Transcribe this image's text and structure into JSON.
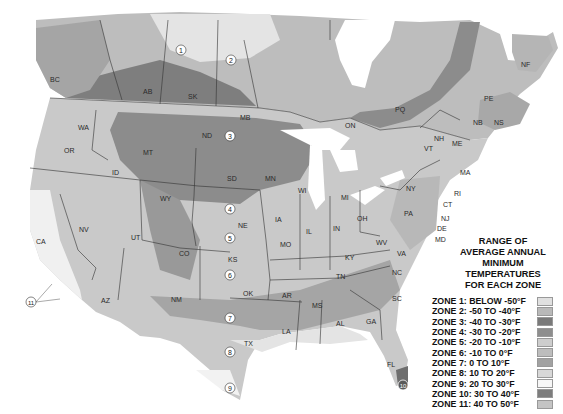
{
  "legend": {
    "title_lines": [
      "RANGE OF",
      "AVERAGE ANNUAL",
      "MINIMUM TEMPERATURES",
      "FOR EACH ZONE"
    ],
    "zones": [
      {
        "label": "ZONE 1: BELOW -50°F",
        "color": "#e0e0e0"
      },
      {
        "label": "ZONE 2: -50 TO -40°F",
        "color": "#b9b9b9"
      },
      {
        "label": "ZONE 3: -40 TO -30°F",
        "color": "#7a7a7a"
      },
      {
        "label": "ZONE 4: -30 TO -20°F",
        "color": "#8e8e8e"
      },
      {
        "label": "ZONE 5: -20 TO -10°F",
        "color": "#cdcdcd"
      },
      {
        "label": "ZONE 6: -10 TO 0°F",
        "color": "#bdbdbd"
      },
      {
        "label": "ZONE 7: 0 TO 10°F",
        "color": "#a2a2a2"
      },
      {
        "label": "ZONE 8: 10 TO 20°F",
        "color": "#d8d8d8"
      },
      {
        "label": "ZONE 9: 20 TO 30°F",
        "color": "#f7f7f7"
      },
      {
        "label": "ZONE 10: 30 TO 40°F",
        "color": "#7d7d7d"
      },
      {
        "label": "ZONE 11: 40 TO 50°F",
        "color": "#c4c4c4"
      }
    ]
  },
  "map": {
    "region_labels": {
      "BC": "BC",
      "AB": "AB",
      "SK": "SK",
      "MB": "MB",
      "ON": "ON",
      "PQ": "PQ",
      "NF": "NF",
      "PE": "PE",
      "NB": "NB",
      "NS": "NS",
      "WA": "WA",
      "OR": "OR",
      "ID": "ID",
      "MT": "MT",
      "WY": "WY",
      "NV": "NV",
      "CA": "CA",
      "UT": "UT",
      "CO": "CO",
      "AZ": "AZ",
      "NM": "NM",
      "ND": "ND",
      "SD": "SD",
      "NE": "NE",
      "KS": "KS",
      "OK": "OK",
      "TX": "TX",
      "MN": "MN",
      "IA": "IA",
      "MO": "MO",
      "AR": "AR",
      "LA": "LA",
      "WI": "WI",
      "IL": "IL",
      "MI": "MI",
      "IN": "IN",
      "OH": "OH",
      "KY": "KY",
      "TN": "TN",
      "MS": "MS",
      "AL": "AL",
      "GA": "GA",
      "FL": "FL",
      "SC": "SC",
      "NC": "NC",
      "VA": "VA",
      "WV": "WV",
      "PA": "PA",
      "NY": "NY",
      "VT": "VT",
      "NH": "NH",
      "ME": "ME",
      "MA": "MA",
      "RI": "RI",
      "CT": "CT",
      "NJ": "NJ",
      "DE": "DE",
      "MD": "MD"
    },
    "zone_markers": [
      "1",
      "2",
      "3",
      "4",
      "5",
      "6",
      "7",
      "8",
      "9",
      "10",
      "11"
    ]
  }
}
